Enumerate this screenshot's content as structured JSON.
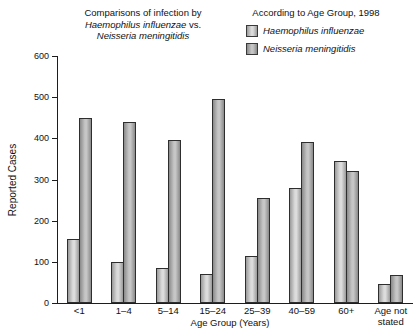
{
  "title": {
    "left_line1": "Comparisons of infection by",
    "left_line2_italic": "Haemophilus influenzae",
    "left_line2_suffix": " vs.",
    "left_line3_italic": "Neisseria meningitidis",
    "right": "According to Age Group, 1998"
  },
  "legend": {
    "items": [
      {
        "label": "Haemophilus influenzae",
        "key": "haemophilus"
      },
      {
        "label": "Neisseria meningitidis",
        "key": "neisseria"
      }
    ]
  },
  "colors": {
    "axis": "#1d1d1d",
    "bar_border": "#2e2e2e",
    "haemophilus_center": "#dcdcdc",
    "haemophilus_edge": "#9a9a9a",
    "neisseria_center": "#c6c6c6",
    "neisseria_edge": "#8a8a8a"
  },
  "chart_data": {
    "type": "bar",
    "categories": [
      "<1",
      "1–4",
      "5–14",
      "15–24",
      "25–39",
      "40–59",
      "60+",
      "Age not\nstated"
    ],
    "series": [
      {
        "name": "Haemophilus influenzae",
        "key": "haemophilus",
        "values": [
          155,
          100,
          85,
          70,
          115,
          280,
          345,
          45
        ]
      },
      {
        "name": "Neisseria meningitidis",
        "key": "neisseria",
        "values": [
          450,
          440,
          395,
          495,
          255,
          390,
          320,
          67
        ]
      }
    ],
    "title": "Comparisons of infection by Haemophilus influenzae vs. Neisseria meningitidis According to Age Group, 1998",
    "xlabel": "Age Group (Years)",
    "ylabel": "Reported Cases",
    "ylim": [
      0,
      600
    ],
    "yticks": [
      0,
      100,
      200,
      300,
      400,
      500,
      600
    ],
    "grid": false,
    "legend_position": "top-right"
  }
}
